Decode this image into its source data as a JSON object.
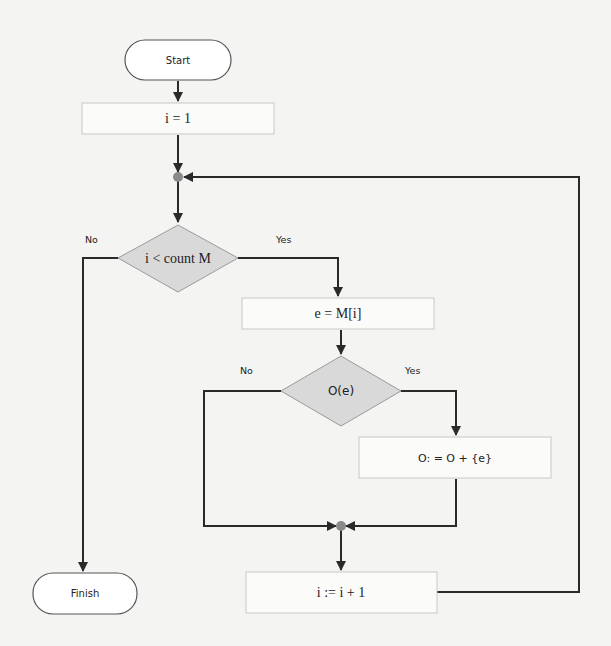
{
  "diagram": {
    "type": "flowchart",
    "colors": {
      "background": "#f4f4f2",
      "line": "#2a2a2a",
      "process_fill": "#fbfbfa",
      "process_stroke": "#c8c8c8",
      "decision_fill": "#d9d9d9",
      "decision_stroke": "#9a9a9a",
      "terminal_fill": "#ffffff",
      "terminal_stroke": "#555555",
      "junction": "#8a8a8a"
    },
    "nodes": {
      "start": {
        "label": "Start",
        "shape": "terminal"
      },
      "init": {
        "label": "i = 1",
        "shape": "process"
      },
      "loop_check": {
        "label": "i < count M",
        "shape": "decision"
      },
      "assign_e": {
        "label": "e = M[i]",
        "shape": "process"
      },
      "check_o": {
        "label": "O(e)",
        "shape": "decision"
      },
      "add_to_o": {
        "label": "O: = O + {e}",
        "shape": "process"
      },
      "increment": {
        "label": "i := i + 1",
        "shape": "process"
      },
      "finish": {
        "label": "Finish",
        "shape": "terminal"
      }
    },
    "edge_labels": {
      "loop_no": "No",
      "loop_yes": "Yes",
      "check_no": "No",
      "check_yes": "Yes"
    },
    "edges": [
      {
        "from": "start",
        "to": "init"
      },
      {
        "from": "init",
        "to": "junction_top"
      },
      {
        "from": "junction_top",
        "to": "loop_check"
      },
      {
        "from": "loop_check",
        "to": "finish",
        "label": "No"
      },
      {
        "from": "loop_check",
        "to": "assign_e",
        "label": "Yes"
      },
      {
        "from": "assign_e",
        "to": "check_o"
      },
      {
        "from": "check_o",
        "to": "junction_bottom",
        "label": "No"
      },
      {
        "from": "check_o",
        "to": "add_to_o",
        "label": "Yes"
      },
      {
        "from": "add_to_o",
        "to": "junction_bottom"
      },
      {
        "from": "junction_bottom",
        "to": "increment"
      },
      {
        "from": "increment",
        "to": "junction_top"
      }
    ]
  }
}
